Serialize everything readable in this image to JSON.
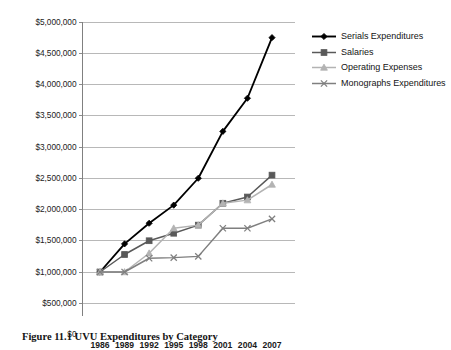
{
  "caption": {
    "label": "Figure 11.1",
    "title": "UVU Expenditures by Category",
    "full": "Figure 11.1  UVU Expenditures by Category"
  },
  "legend": {
    "position": "right",
    "items": [
      {
        "label": "Serials Expenditures",
        "color": "#000000",
        "marker": "diamond"
      },
      {
        "label": "Salaries",
        "color": "#595959",
        "marker": "square"
      },
      {
        "label": "Operating Expenses",
        "color": "#b3b3b3",
        "marker": "triangle"
      },
      {
        "label": "Monographs Expenditures",
        "color": "#7f7f7f",
        "marker": "x"
      }
    ]
  },
  "axes": {
    "y_ticks": [
      "$0",
      "$500,000",
      "$1,000,000",
      "$1,500,000",
      "$2,000,000",
      "$2,500,000",
      "$3,000,000",
      "$3,500,000",
      "$4,000,000",
      "$4,500,000",
      "$5,000,000"
    ],
    "x_ticks": [
      "1986",
      "1989",
      "1992",
      "1995",
      "1998",
      "2001",
      "2004",
      "2007"
    ],
    "ylabel": "",
    "xlabel": ""
  },
  "chart_data": {
    "type": "line",
    "title": "Figure 11.1  UVU Expenditures by Category",
    "xlabel": "",
    "ylabel": "",
    "categories": [
      "1986",
      "1989",
      "1992",
      "1995",
      "1998",
      "2001",
      "2004",
      "2007"
    ],
    "x": [
      1986,
      1989,
      1992,
      1995,
      1998,
      2001,
      2004,
      2007
    ],
    "ylim": [
      0,
      5000000
    ],
    "ytick_step": 500000,
    "grid": "horizontal",
    "legend_position": "right",
    "series": [
      {
        "name": "Serials Expenditures",
        "color": "#000000",
        "marker": "diamond",
        "values": [
          1000000,
          1450000,
          1780000,
          2070000,
          2500000,
          3250000,
          3780000,
          4750000
        ]
      },
      {
        "name": "Salaries",
        "color": "#595959",
        "marker": "square",
        "values": [
          1000000,
          1280000,
          1500000,
          1620000,
          1750000,
          2100000,
          2200000,
          2550000
        ]
      },
      {
        "name": "Operating Expenses",
        "color": "#b3b3b3",
        "marker": "triangle",
        "values": [
          1000000,
          1000000,
          1300000,
          1700000,
          1750000,
          2100000,
          2150000,
          2400000
        ]
      },
      {
        "name": "Monographs Expenditures",
        "color": "#7f7f7f",
        "marker": "x",
        "values": [
          1000000,
          1000000,
          1220000,
          1230000,
          1250000,
          1700000,
          1700000,
          1850000
        ]
      }
    ]
  }
}
